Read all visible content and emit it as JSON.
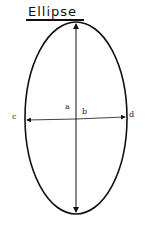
{
  "title": "Ellipse",
  "labels": {
    "a": "a",
    "b": "b",
    "c": "c",
    "d": "d"
  },
  "colors": {
    "stroke": "#111111",
    "background": "#ffffff"
  }
}
